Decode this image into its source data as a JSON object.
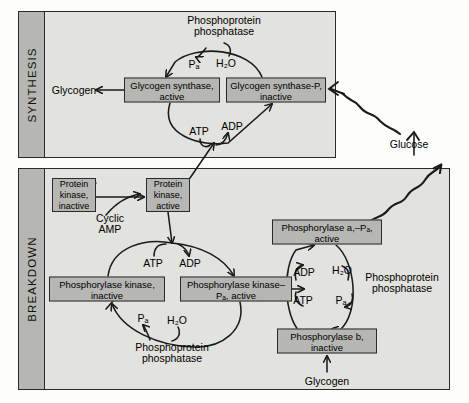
{
  "figure": {
    "type": "biochemical-pathway-diagram",
    "canvas": {
      "width": 469,
      "height": 403
    },
    "colors": {
      "box_fill": "#b6b6b2",
      "panel_fill": "#e2e2de",
      "stroke": "#2a2a2a",
      "text": "#000000",
      "page": "#fdfdfb"
    }
  },
  "panels": [
    {
      "id": "synthesis",
      "label": "SYNTHESIS",
      "x": 18,
      "y": 11,
      "width": 318,
      "height": 147,
      "tab_width": 26
    },
    {
      "id": "breakdown",
      "label": "BREAKDOWN",
      "x": 18,
      "y": 168,
      "width": 432,
      "height": 222,
      "tab_width": 26
    }
  ],
  "boxes": [
    {
      "id": "glycogen-synthase-active",
      "line1": "Glycogen synthase,",
      "line2": "active",
      "cx": 172,
      "cy": 90,
      "w": 96,
      "h": 25
    },
    {
      "id": "glycogen-synthase-p",
      "line1": "Glycogen synthase-P,",
      "line2": "inactive",
      "cx": 276,
      "cy": 90,
      "w": 100,
      "h": 25
    },
    {
      "id": "protein-kinase-inactive",
      "line1": "Protein",
      "line2": "kinase,",
      "line3": "inactive",
      "cx": 74,
      "cy": 195,
      "w": 44,
      "h": 34
    },
    {
      "id": "protein-kinase-active",
      "line1": "Protein",
      "line2": "kinase,",
      "line3": "active",
      "cx": 168,
      "cy": 195,
      "w": 44,
      "h": 34
    },
    {
      "id": "phosphorylase-kinase-inactive",
      "line1": "Phosphorylase kinase,",
      "line2": "inactive",
      "cx": 107,
      "cy": 289,
      "w": 116,
      "h": 25
    },
    {
      "id": "phosphorylase-kinase-p-active",
      "line1": "Phosphorylase kinase–",
      "line2": "P&#8336;, active",
      "cx": 236,
      "cy": 289,
      "w": 112,
      "h": 25
    },
    {
      "id": "phosphorylase-a-p-active",
      "line1": "Phosphorylase a,–P&#8336;,",
      "line2": "active",
      "cx": 327,
      "cy": 232,
      "w": 110,
      "h": 25
    },
    {
      "id": "phosphorylase-b-inactive",
      "line1": "Phosphorylase b,",
      "line2": "inactive",
      "cx": 327,
      "cy": 341,
      "w": 100,
      "h": 25
    }
  ],
  "labels": [
    {
      "id": "phosphoprotein-phosphatase-top",
      "text": "Phosphoprotein\nphosphatase",
      "cx": 224,
      "cy": 26,
      "size": 10.5
    },
    {
      "id": "pi-top",
      "text": "P&#8336;",
      "cx": 194,
      "cy": 64,
      "size": 10.5
    },
    {
      "id": "h2o-top",
      "text": "H&#8322;O",
      "cx": 226,
      "cy": 63,
      "size": 10.5
    },
    {
      "id": "glycogen-left",
      "text": "Glycogen",
      "cx": 74,
      "cy": 90,
      "size": 10.5
    },
    {
      "id": "atp-top",
      "text": "ATP",
      "cx": 199,
      "cy": 131,
      "size": 10.5
    },
    {
      "id": "adp-top",
      "text": "ADP",
      "cx": 232,
      "cy": 126,
      "size": 10.5
    },
    {
      "id": "glucose",
      "text": "Glucose",
      "cx": 409,
      "cy": 144,
      "size": 10.5
    },
    {
      "id": "cyclic-amp",
      "text": "Cyclic\nAMP",
      "cx": 110,
      "cy": 224,
      "size": 10.5
    },
    {
      "id": "atp-left",
      "text": "ATP",
      "cx": 153,
      "cy": 263,
      "size": 10.5
    },
    {
      "id": "adp-left",
      "text": "ADP",
      "cx": 190,
      "cy": 263,
      "size": 10.5
    },
    {
      "id": "pi-left",
      "text": "P&#8336;",
      "cx": 143,
      "cy": 318,
      "size": 10.5
    },
    {
      "id": "h2o-left",
      "text": "H&#8322;O",
      "cx": 177,
      "cy": 320,
      "size": 10.5
    },
    {
      "id": "phosphoprotein-phosphatase-bottom",
      "text": "Phosphoprotein\nphosphatase",
      "cx": 172,
      "cy": 353,
      "size": 10.5
    },
    {
      "id": "adp-right",
      "text": "ADP",
      "cx": 304,
      "cy": 272,
      "size": 10.5
    },
    {
      "id": "h2o-right",
      "text": "H&#8322;O",
      "cx": 342,
      "cy": 270,
      "size": 10.5
    },
    {
      "id": "atp-right",
      "text": "ATP",
      "cx": 303,
      "cy": 300,
      "size": 10.5
    },
    {
      "id": "pi-right",
      "text": "P&#8336;",
      "cx": 341,
      "cy": 300,
      "size": 10.5
    },
    {
      "id": "phosphoprotein-phosphatase-right",
      "text": "Phosphoprotein\nphosphatase",
      "cx": 402,
      "cy": 283,
      "size": 10.5
    },
    {
      "id": "glycogen-bottom",
      "text": "Glycogen",
      "cx": 327,
      "cy": 381,
      "size": 10.5
    }
  ],
  "reactions": [
    {
      "from": "glycogen-synthase-p",
      "to": "glycogen-synthase-active",
      "cofactor_in": "H₂O",
      "cofactor_out": "Pᵢ",
      "enzyme": "Phosphoprotein phosphatase"
    },
    {
      "from": "glycogen-synthase-active",
      "to": "glycogen-synthase-p",
      "cofactor_in": "ATP",
      "cofactor_out": "ADP",
      "enzyme": "Phosphorylase kinase–Pᵢ, active"
    },
    {
      "from": "glycogen-synthase-active",
      "to": "Glycogen",
      "type": "product"
    },
    {
      "from": "protein-kinase-inactive",
      "to": "protein-kinase-active",
      "activator": "Cyclic AMP"
    },
    {
      "from": "phosphorylase-kinase-inactive",
      "to": "phosphorylase-kinase-p-active",
      "cofactor_in": "ATP",
      "cofactor_out": "ADP",
      "enzyme": "Protein kinase, active"
    },
    {
      "from": "phosphorylase-kinase-p-active",
      "to": "phosphorylase-kinase-inactive",
      "cofactor_in": "H₂O",
      "cofactor_out": "Pᵢ",
      "enzyme": "Phosphoprotein phosphatase"
    },
    {
      "from": "phosphorylase-b-inactive",
      "to": "phosphorylase-a-p-active",
      "cofactor_in": "ATP",
      "cofactor_out": "ADP",
      "enzyme": "Phosphorylase kinase–Pᵢ, active"
    },
    {
      "from": "phosphorylase-a-p-active",
      "to": "phosphorylase-b-inactive",
      "cofactor_in": "H₂O",
      "cofactor_out": "Pᵢ",
      "enzyme": "Phosphoprotein phosphatase"
    },
    {
      "from": "Glycogen",
      "to": "phosphorylase-b-inactive",
      "type": "substrate"
    },
    {
      "from": "phosphorylase-a-p-active",
      "to": "Glucose",
      "type": "wavy-product"
    },
    {
      "from": "Glucose",
      "to": "glycogen-synthase-p",
      "type": "wavy-signal"
    }
  ]
}
